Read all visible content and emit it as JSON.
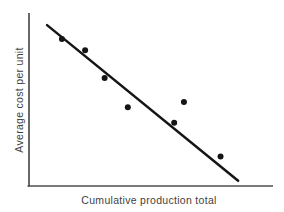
{
  "figure": {
    "background": "#ffffff"
  },
  "chart_data": {
    "type": "scatter",
    "title": "",
    "xlabel": "Cumulative production total",
    "ylabel": "Average cost per unit",
    "x_ticks": [],
    "y_ticks": [],
    "xlim": [
      0,
      100
    ],
    "ylim": [
      0,
      100
    ],
    "grid": false,
    "legend": "none",
    "axis_color": "#4f4f4f",
    "marker_color": "#151515",
    "trend_color": "#151515",
    "text_color": "#3f3f3f",
    "points": [
      {
        "x": 13.5,
        "y": 85
      },
      {
        "x": 23,
        "y": 78.5
      },
      {
        "x": 31,
        "y": 62.5
      },
      {
        "x": 40.5,
        "y": 45.5
      },
      {
        "x": 59.5,
        "y": 36.5
      },
      {
        "x": 63.5,
        "y": 48.5
      },
      {
        "x": 78.5,
        "y": 17
      }
    ],
    "trendline": {
      "x1": 7.4,
      "y1": 93,
      "x2": 85.7,
      "y2": 3
    },
    "marker_radius_px": 3,
    "trend_width_px": 2.5,
    "axis_width_px": 1.7,
    "plot_box_px": {
      "left": 29,
      "right": 273,
      "top": 13,
      "bottom": 186
    }
  }
}
